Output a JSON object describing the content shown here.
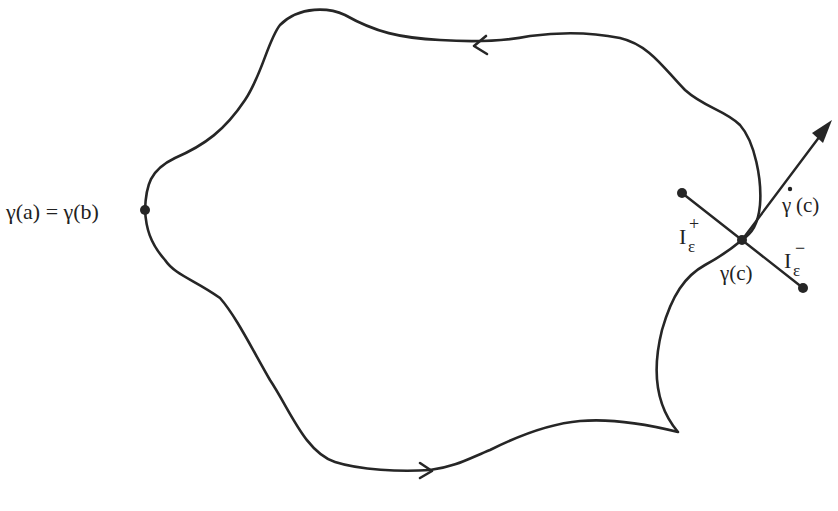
{
  "diagram": {
    "type": "closed-curve-with-tangent",
    "labels": {
      "endpoint": "γ(a) = γ(b)",
      "point": "γ(c)",
      "tangent": "γ̇(c)",
      "tangent_base": "γ",
      "tangent_arg": "(c)",
      "interval_plus_base": "I",
      "interval_plus_sub": "ε",
      "interval_plus_sup": "+",
      "interval_minus_base": "I",
      "interval_minus_sub": "ε",
      "interval_minus_sup": "−"
    },
    "points": [
      {
        "name": "gamma-a-equals-gamma-b",
        "x": 145,
        "y": 210
      },
      {
        "name": "gamma-c",
        "x": 742,
        "y": 240
      },
      {
        "name": "I-plus-endpoint",
        "x": 682,
        "y": 193
      },
      {
        "name": "I-minus-endpoint",
        "x": 803,
        "y": 288
      }
    ],
    "orientation_arrows": [
      {
        "location": "top",
        "direction": "left"
      },
      {
        "location": "bottom",
        "direction": "right"
      }
    ],
    "colors": {
      "stroke": "#262626",
      "background": "#ffffff"
    }
  }
}
